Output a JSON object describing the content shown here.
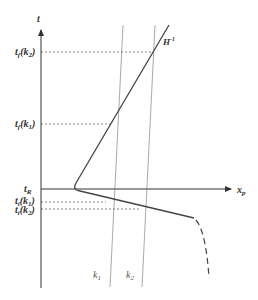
{
  "diagram": {
    "axes": {
      "y_label": "t",
      "x_label": "x",
      "x_label_sub": "p",
      "origin_label": "t",
      "origin_label_sub": "R"
    },
    "y_ticks": [
      {
        "main": "t",
        "sub": "f",
        "arg": "(k",
        "arg_sub": "2",
        "close": ")"
      },
      {
        "main": "t",
        "sub": "f",
        "arg": "(k",
        "arg_sub": "1",
        "close": ")"
      },
      {
        "main": "t",
        "sub": "i",
        "arg": "(k",
        "arg_sub": "1",
        "close": ")"
      },
      {
        "main": "t",
        "sub": "i",
        "arg": "(k",
        "arg_sub": "2",
        "close": ")"
      }
    ],
    "curve_label": {
      "main": "H",
      "sup": "-1"
    },
    "line_labels": [
      {
        "main": "k",
        "sub": "1"
      },
      {
        "main": "k",
        "sub": "2"
      }
    ],
    "colors": {
      "axis": "#333333",
      "curve": "#444444",
      "k_lines": "#aaaaaa",
      "dashed": "#666666"
    }
  }
}
